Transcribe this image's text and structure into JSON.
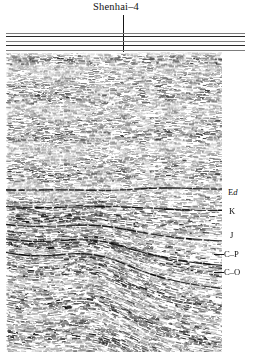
{
  "figure": {
    "type": "seismic-reflection-section",
    "title": "Shenhai–4",
    "well_name": "Shenhai–4",
    "background_color": "#ffffff",
    "trace_color": "#111111",
    "rule_color": "#7d7d7d"
  },
  "well": {
    "label": "Shenhai–4",
    "marker_type": "vertical-line",
    "x_fraction": 0.463,
    "top_y_fraction": 0.041,
    "bottom_y_fraction": 0.569
  },
  "top_rules": {
    "count": 3,
    "color": "#7d7d7d",
    "labels": [
      "",
      "",
      ""
    ]
  },
  "horizons": [
    {
      "id": "Ed",
      "label": "Ed",
      "label_plain": "Ed",
      "italic_part": "d",
      "leader": false,
      "y_fraction": 0.523
    },
    {
      "id": "K",
      "label": "K",
      "label_plain": "K",
      "italic_part": "",
      "leader": false,
      "y_fraction": 0.575
    },
    {
      "id": "J",
      "label": "J",
      "label_plain": "J",
      "italic_part": "",
      "leader": false,
      "y_fraction": 0.641
    },
    {
      "id": "C-P",
      "label": "C–P",
      "label_plain": "C-P",
      "italic_part": "",
      "leader": true,
      "y_fraction": 0.694
    },
    {
      "id": "C-O",
      "label": "C–O",
      "label_plain": "C-O",
      "italic_part": "",
      "leader": true,
      "y_fraction": 0.744
    }
  ],
  "chart_data": {
    "type": "line",
    "title": "Shenhai–4",
    "xlabel": "",
    "ylabel": "",
    "legend": [],
    "grid": false,
    "annotations": [
      "Ed",
      "K",
      "J",
      "C–P",
      "C–O",
      "Shenhai–4"
    ],
    "structure": {
      "style": "anticline",
      "crest_x_fraction": 0.4,
      "crest_y_fraction": 0.62,
      "left_flank_dip_deg": -22,
      "right_flank_dip_deg": 17,
      "flat_layer_bottom_fraction": 0.5
    },
    "series": [
      {
        "name": "Ed",
        "values": [
          0.523
        ]
      },
      {
        "name": "K",
        "values": [
          0.575
        ]
      },
      {
        "name": "J",
        "values": [
          0.641
        ]
      },
      {
        "name": "C–P",
        "values": [
          0.694
        ]
      },
      {
        "name": "C–O",
        "values": [
          0.744
        ]
      }
    ]
  }
}
